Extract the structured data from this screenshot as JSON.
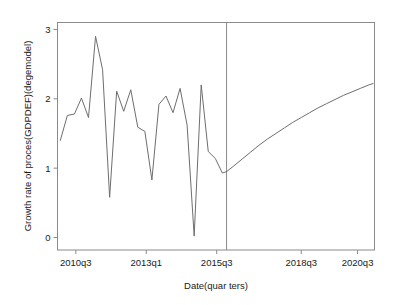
{
  "chart_data": {
    "type": "line",
    "title": "",
    "xlabel": "Date(quar ters)",
    "ylabel": "Growth rate of proces(GDPDEF)(degemodel)",
    "ylim": [
      -0.18,
      3.1
    ],
    "yticks": [
      "0",
      "1",
      "2",
      "3"
    ],
    "ytick_values": [
      0,
      1,
      2,
      3
    ],
    "xticks": [
      "2010q3",
      "2013q1",
      "2015q3",
      "2018q3",
      "2020q3"
    ],
    "xtick_values": [
      2010.5,
      2013.0,
      2015.5,
      2018.5,
      2020.5
    ],
    "xlim": [
      2009.85,
      2021.1
    ],
    "grid": false,
    "legend": false,
    "annotations": [
      {
        "name": "forecast-divider",
        "type": "vertical-line",
        "x": 2015.85,
        "label": ""
      }
    ],
    "series": [
      {
        "name": "historical",
        "style": "solid",
        "color": "#6e6e6e",
        "x": [
          2009.95,
          2010.2,
          2010.45,
          2010.7,
          2010.95,
          2011.2,
          2011.45,
          2011.7,
          2011.95,
          2012.2,
          2012.45,
          2012.7,
          2012.95,
          2013.2,
          2013.45,
          2013.7,
          2013.95,
          2014.2,
          2014.45,
          2014.7,
          2014.95,
          2015.2,
          2015.45,
          2015.7,
          2015.85
        ],
        "values": [
          1.4,
          1.76,
          1.78,
          2.01,
          1.73,
          2.9,
          2.42,
          0.58,
          2.11,
          1.82,
          2.13,
          1.59,
          1.53,
          0.83,
          1.92,
          2.04,
          1.8,
          2.15,
          1.62,
          0.02,
          2.2,
          1.24,
          1.14,
          0.93,
          0.95
        ]
      },
      {
        "name": "forecast",
        "style": "solid",
        "color": "#6e6e6e",
        "x": [
          2015.85,
          2016.1,
          2016.4,
          2016.7,
          2017.0,
          2017.3,
          2017.6,
          2017.9,
          2018.2,
          2018.5,
          2018.8,
          2019.1,
          2019.4,
          2019.7,
          2020.0,
          2020.3,
          2020.6,
          2020.9,
          2021.05
        ],
        "values": [
          0.95,
          1.03,
          1.13,
          1.23,
          1.33,
          1.42,
          1.5,
          1.58,
          1.66,
          1.73,
          1.8,
          1.87,
          1.93,
          1.99,
          2.05,
          2.1,
          2.15,
          2.2,
          2.22
        ]
      }
    ]
  },
  "colors": {
    "line": "#6e6e6e",
    "frame": "#8a8a8a",
    "text": "#1a1a1a",
    "background": "#ffffff"
  }
}
